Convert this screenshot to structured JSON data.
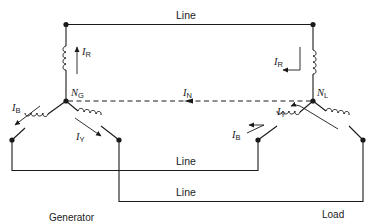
{
  "diagram": {
    "lines": {
      "top": "Line",
      "middle": "Line",
      "bottom": "Line"
    },
    "nodes": {
      "generator_neutral": {
        "symbol": "N",
        "subscript": "G"
      },
      "load_neutral": {
        "symbol": "N",
        "subscript": "L"
      }
    },
    "currents": {
      "gen_red": {
        "symbol": "I",
        "subscript": "R"
      },
      "gen_blue": {
        "symbol": "I",
        "subscript": "B"
      },
      "gen_yellow": {
        "symbol": "I",
        "subscript": "Y"
      },
      "neutral": {
        "symbol": "I",
        "subscript": "N"
      },
      "load_red": {
        "symbol": "I",
        "subscript": "R"
      },
      "load_yellow": {
        "symbol": "I",
        "subscript": "Y"
      },
      "load_blue": {
        "symbol": "I",
        "subscript": "B"
      }
    },
    "captions": {
      "generator": "Generator",
      "load": "Load"
    },
    "colors": {
      "ink": "#1a1a1a",
      "background": "#ffffff"
    }
  }
}
